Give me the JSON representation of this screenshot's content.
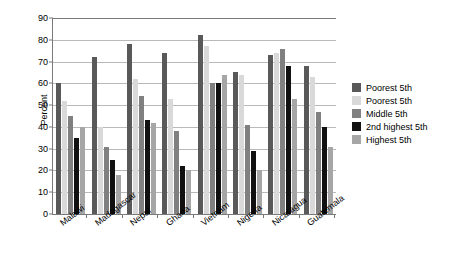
{
  "chart_data": {
    "type": "bar",
    "title": "",
    "xlabel": "",
    "ylabel": "Percent",
    "ylim": [
      0,
      90
    ],
    "yticks": [
      0,
      10,
      20,
      30,
      40,
      50,
      60,
      70,
      80,
      90
    ],
    "grid": true,
    "legend_position": "right",
    "categories": [
      "Malawi",
      "Madagascar",
      "Nepal",
      "Ghana",
      "Vietnam",
      "Nigeria",
      "Nicaragua",
      "Guatemala"
    ],
    "series": [
      {
        "name": "Poorest 5th",
        "color": "#595959",
        "values": [
          60,
          72,
          78,
          74,
          82,
          65,
          73,
          68
        ]
      },
      {
        "name": "Poorest 5th",
        "color": "#d9d9d9",
        "values": [
          52,
          40,
          62,
          53,
          77,
          64,
          74,
          63
        ]
      },
      {
        "name": "Middle 5th",
        "color": "#808080",
        "values": [
          45,
          31,
          54,
          38,
          60,
          41,
          76,
          47
        ]
      },
      {
        "name": "2nd highest 5th",
        "color": "#111111",
        "values": [
          35,
          25,
          43,
          22,
          60,
          29,
          68,
          40
        ]
      },
      {
        "name": "Highest 5th",
        "color": "#a6a6a6",
        "values": [
          40,
          18,
          42,
          20,
          64,
          20,
          53,
          31
        ]
      }
    ]
  },
  "legend": {
    "items": [
      {
        "label": "Poorest 5th",
        "color": "#595959"
      },
      {
        "label": "Poorest 5th",
        "color": "#d9d9d9"
      },
      {
        "label": "Middle 5th",
        "color": "#808080"
      },
      {
        "label": "2nd highest 5th",
        "color": "#111111"
      },
      {
        "label": "Highest 5th",
        "color": "#a6a6a6"
      }
    ]
  }
}
